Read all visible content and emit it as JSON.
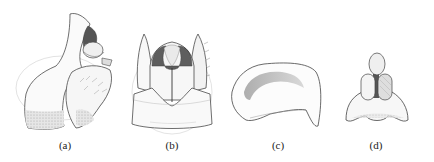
{
  "figure": {
    "panels": [
      {
        "id": "a",
        "label": "(a)",
        "description": "lateral view",
        "label_x": 65
      },
      {
        "id": "b",
        "label": "(b)",
        "description": "dorsal/ventral view",
        "label_x": 172
      },
      {
        "id": "c",
        "label": "(c)",
        "description": "sclerite plate",
        "label_x": 278
      },
      {
        "id": "d",
        "label": "(d)",
        "description": "posterior view",
        "label_x": 376
      }
    ],
    "colors": {
      "outline": "#4a4a4a",
      "shade_light": "#d8d8d8",
      "shade_mid": "#b0b0b0",
      "shade_dark": "#555555",
      "faint": "#c8c8c8",
      "background": "#ffffff"
    }
  }
}
